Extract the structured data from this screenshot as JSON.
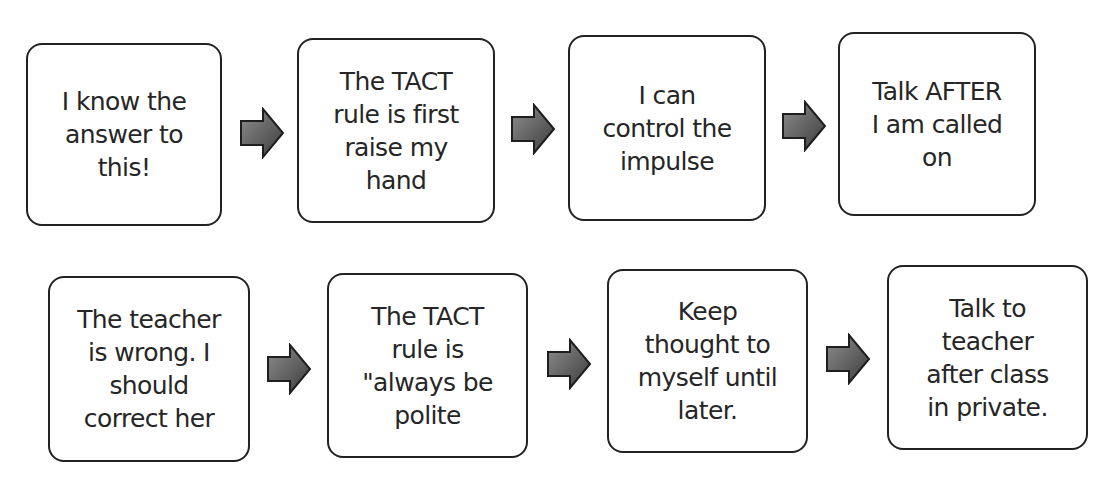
{
  "diagram": {
    "type": "flowchart",
    "direction": "left-to-right",
    "colors": {
      "box_border": "#222222",
      "box_fill": "#ffffff",
      "text": "#262626",
      "arrow_light": "#8a8a8a",
      "arrow_dark": "#3a3a3a",
      "arrow_stroke": "#1e1e1e"
    },
    "rows": [
      {
        "boxes": [
          {
            "text": "I know the\nanswer to\nthis!"
          },
          {
            "text": "The TACT\nrule is first\nraise my\nhand"
          },
          {
            "text": "I can\ncontrol the\nimpulse"
          },
          {
            "text": "Talk AFTER\nI am called\non"
          }
        ]
      },
      {
        "boxes": [
          {
            "text": "The teacher\nis wrong.  I\nshould\ncorrect her"
          },
          {
            "text": "The TACT\nrule is\n\"always be\npolite"
          },
          {
            "text": "Keep\nthought to\nmyself until\nlater."
          },
          {
            "text": "Talk to\nteacher\nafter class\nin private."
          }
        ]
      }
    ],
    "arrows": [
      {
        "icon": "right-arrow-icon",
        "from": "rows.0.boxes.0",
        "to": "rows.0.boxes.1"
      },
      {
        "icon": "right-arrow-icon",
        "from": "rows.0.boxes.1",
        "to": "rows.0.boxes.2"
      },
      {
        "icon": "right-arrow-icon",
        "from": "rows.0.boxes.2",
        "to": "rows.0.boxes.3"
      },
      {
        "icon": "right-arrow-icon",
        "from": "rows.1.boxes.0",
        "to": "rows.1.boxes.1"
      },
      {
        "icon": "right-arrow-icon",
        "from": "rows.1.boxes.1",
        "to": "rows.1.boxes.2"
      },
      {
        "icon": "right-arrow-icon",
        "from": "rows.1.boxes.2",
        "to": "rows.1.boxes.3"
      }
    ]
  }
}
